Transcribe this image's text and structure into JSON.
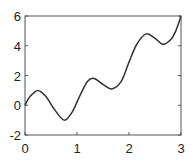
{
  "chart_data": {
    "type": "line",
    "title": "",
    "xlabel": "",
    "ylabel": "",
    "xlim": [
      0,
      3
    ],
    "ylim": [
      -2,
      6
    ],
    "grid": false,
    "legend": null,
    "x_ticks": [
      "0",
      "1",
      "2",
      "3"
    ],
    "y_ticks": [
      "-2",
      "0",
      "2",
      "4",
      "6"
    ],
    "series": [
      {
        "name": "curve",
        "color": "#333333",
        "x": [
          0,
          0.1,
          0.25,
          0.4,
          0.55,
          0.75,
          0.9,
          1.05,
          1.2,
          1.33,
          1.5,
          1.67,
          1.85,
          2.0,
          2.15,
          2.33,
          2.5,
          2.65,
          2.8,
          2.9,
          3.0
        ],
        "y": [
          0,
          0.6,
          1.0,
          0.6,
          -0.2,
          -1.0,
          -0.5,
          0.6,
          1.6,
          1.8,
          1.4,
          1.1,
          1.6,
          2.9,
          4.1,
          4.8,
          4.5,
          4.1,
          4.4,
          5.0,
          6.0
        ]
      }
    ]
  }
}
